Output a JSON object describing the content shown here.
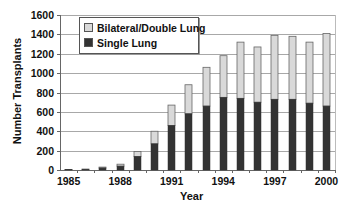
{
  "chart_data": {
    "type": "bar",
    "stacked": true,
    "title": "",
    "xlabel": "Year",
    "ylabel": "Number Transplants",
    "ylim": [
      0,
      1600
    ],
    "yticks": [
      0,
      200,
      400,
      600,
      800,
      1000,
      1200,
      1400,
      1600
    ],
    "xtick_labels": [
      "1985",
      "1988",
      "1991",
      "1994",
      "1997",
      "2000"
    ],
    "grid": true,
    "legend_position": "upper left",
    "categories": [
      "1985",
      "1986",
      "1987",
      "1988",
      "1989",
      "1990",
      "1991",
      "1992",
      "1993",
      "1994",
      "1995",
      "1996",
      "1997",
      "1998",
      "1999",
      "2000"
    ],
    "series": [
      {
        "name": "Single Lung",
        "color": "#333333",
        "values": [
          3,
          5,
          20,
          40,
          140,
          270,
          460,
          580,
          660,
          750,
          740,
          700,
          730,
          730,
          690,
          660
        ]
      },
      {
        "name": "Bilateral/Double Lung",
        "color": "#d9d9d9",
        "values": [
          2,
          5,
          10,
          20,
          50,
          130,
          210,
          300,
          400,
          430,
          580,
          570,
          660,
          650,
          630,
          750
        ]
      }
    ]
  },
  "legend": {
    "items": [
      {
        "label": "Bilateral/Double Lung",
        "color": "#d9d9d9"
      },
      {
        "label": "Single Lung",
        "color": "#333333"
      }
    ]
  },
  "axes": {
    "xlabel": "Year",
    "ylabel": "Number Transplants"
  },
  "caption": "Figure ..."
}
